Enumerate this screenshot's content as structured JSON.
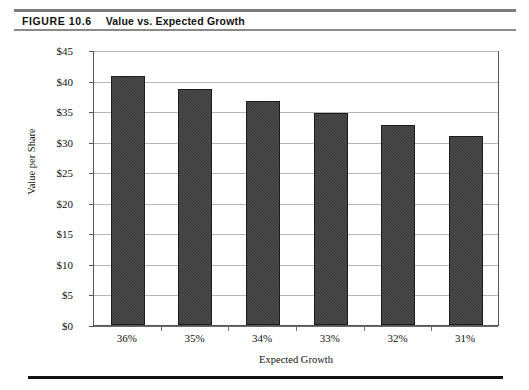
{
  "figure": {
    "label": "FIGURE 10.6",
    "caption": "Value vs. Expected Growth"
  },
  "chart_data": {
    "type": "bar",
    "title": "Value vs. Expected Growth",
    "categories": [
      "36%",
      "35%",
      "34%",
      "33%",
      "32%",
      "31%"
    ],
    "values": [
      40.7,
      38.6,
      36.6,
      34.7,
      32.8,
      31.0
    ],
    "xlabel": "Expected Growth",
    "ylabel": "Value per Share",
    "ylim": [
      0,
      45
    ],
    "ytick_step": 5,
    "ytick_labels": [
      "$0",
      "$5",
      "$10",
      "$15",
      "$20",
      "$25",
      "$30",
      "$35",
      "$40",
      "$45"
    ],
    "ytick_values": [
      0,
      5,
      10,
      15,
      20,
      25,
      30,
      35,
      40,
      45
    ],
    "grid": true,
    "legend": false,
    "bar_color": "#3b3b3b",
    "bar_edge_color": "#1c1c1c",
    "gridline_color": "#b6b6b6",
    "axis_color": "#555555"
  }
}
